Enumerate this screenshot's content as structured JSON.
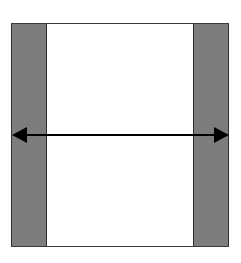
{
  "diagram": {
    "colors": {
      "background": "#ffffff",
      "frame_border": "#3a3a3a",
      "side_band_fill": "#7d7d7d",
      "arrow": "#000000"
    },
    "frame": {
      "x": 11,
      "y": 23,
      "width": 217,
      "height": 223
    },
    "left_band": {
      "x": 11,
      "width": 36
    },
    "right_band": {
      "x": 192,
      "width": 36
    },
    "arrow": {
      "x1": 12,
      "x2": 228,
      "y": 135,
      "type": "double-headed"
    }
  }
}
